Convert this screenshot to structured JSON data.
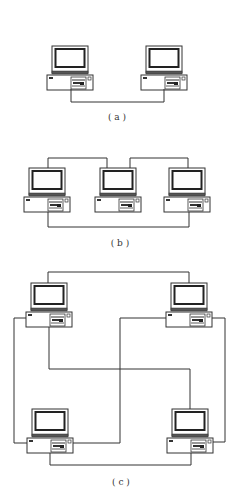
{
  "figure": {
    "background": "#ffffff",
    "line_color": "#333333",
    "panels": [
      {
        "id": "a",
        "label": "( a )",
        "topology": "two computers connected point-to-point",
        "computers": [
          {
            "name": "computer-a1",
            "x": 47,
            "y": 46
          },
          {
            "name": "computer-a2",
            "x": 141,
            "y": 46
          }
        ]
      },
      {
        "id": "b",
        "label": "( b )",
        "topology": "three computers in a ring",
        "computers": [
          {
            "name": "computer-b1",
            "x": 24,
            "y": 168
          },
          {
            "name": "computer-b2",
            "x": 95,
            "y": 168
          },
          {
            "name": "computer-b3",
            "x": 164,
            "y": 168
          }
        ]
      },
      {
        "id": "c",
        "label": "( c )",
        "topology": "four computers fully interconnected",
        "computers": [
          {
            "name": "computer-c-top-left",
            "x": 26,
            "y": 283
          },
          {
            "name": "computer-c-top-right",
            "x": 166,
            "y": 283
          },
          {
            "name": "computer-c-bottom-left",
            "x": 27,
            "y": 409
          },
          {
            "name": "computer-c-bottom-right",
            "x": 167,
            "y": 409
          }
        ]
      }
    ]
  }
}
